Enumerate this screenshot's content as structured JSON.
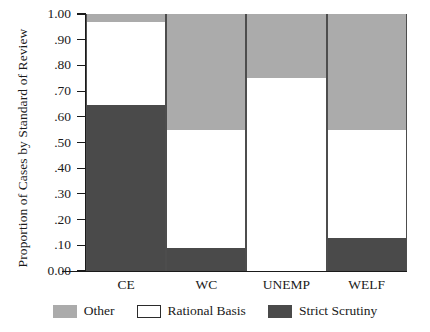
{
  "chart_data": {
    "type": "bar",
    "subtype": "stacked-100-percent",
    "title": "",
    "xlabel": "",
    "ylabel": "Proportion of Cases by Standard of Review",
    "ylim": [
      0.0,
      1.0
    ],
    "ytick_labels": [
      "1.00",
      ".90",
      ".80",
      ".70",
      ".60",
      ".50",
      ".40",
      ".30",
      ".20",
      ".10",
      "0.00"
    ],
    "ytick_values": [
      1.0,
      0.9,
      0.8,
      0.7,
      0.6,
      0.5,
      0.4,
      0.3,
      0.2,
      0.1,
      0.0
    ],
    "categories": [
      "CE",
      "WC",
      "UNEMP",
      "WELF"
    ],
    "grid": false,
    "legend_position": "bottom",
    "stack_order_bottom_to_top": [
      "Strict Scrutiny",
      "Rational Basis",
      "Other"
    ],
    "series": [
      {
        "name": "Strict Scrutiny",
        "color": "#4a4a4a",
        "values": [
          0.645,
          0.09,
          0.0,
          0.13
        ]
      },
      {
        "name": "Rational Basis",
        "color": "#ffffff",
        "values": [
          0.325,
          0.46,
          0.75,
          0.42
        ]
      },
      {
        "name": "Other",
        "color": "#ababab",
        "values": [
          0.03,
          0.45,
          0.25,
          0.45
        ]
      }
    ],
    "cumulative_boundaries": {
      "CE": {
        "strict_top": 0.645,
        "rational_top": 0.97
      },
      "WC": {
        "strict_top": 0.09,
        "rational_top": 0.55
      },
      "UNEMP": {
        "strict_top": 0.0,
        "rational_top": 0.75
      },
      "WELF": {
        "strict_top": 0.13,
        "rational_top": 0.55
      }
    }
  },
  "legend": {
    "items": [
      {
        "label": "Other",
        "swatch": "other"
      },
      {
        "label": "Rational Basis",
        "swatch": "rational"
      },
      {
        "label": "Strict Scrutiny",
        "swatch": "strict"
      }
    ]
  },
  "colors": {
    "other": "#ababab",
    "rational_basis": "#ffffff",
    "strict_scrutiny": "#4a4a4a",
    "axis": "#1a1a1a",
    "background": "#ffffff"
  }
}
